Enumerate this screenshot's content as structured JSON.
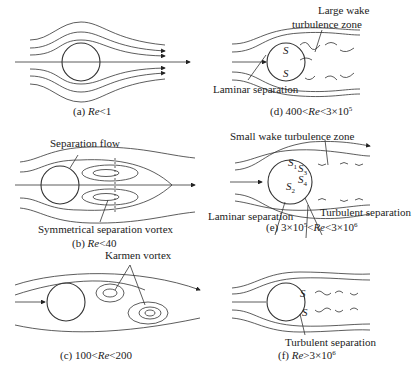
{
  "panels": {
    "a": {
      "caption_prefix": "(a) ",
      "caption_re": "Re",
      "caption_rest": "<1"
    },
    "b": {
      "caption_prefix": "(b) ",
      "caption_re": "Re",
      "caption_rest": "<40",
      "labels": {
        "separation_flow": "Separation flow",
        "vortex": "Symmetrical separation vortex"
      }
    },
    "c": {
      "caption_prefix": "(c) 100<",
      "caption_re": "Re",
      "caption_rest": "<200",
      "labels": {
        "karmen": "Karmen vortex"
      }
    },
    "d": {
      "caption_prefix": "(d) 400<",
      "caption_re": "Re",
      "caption_rest": "<3×10",
      "exp": "5",
      "labels": {
        "wake1": "Large wake",
        "wake2": "turbulence zone",
        "laminar": "Laminar separation",
        "s": "S"
      }
    },
    "e": {
      "caption_prefix": "(e) 3×10",
      "exp1": "5",
      "caption_mid": "<",
      "caption_re": "Re",
      "caption_rest": "<3×10",
      "exp2": "6",
      "labels": {
        "small_wake": "Small wake  turbulence zone",
        "laminar": "Laminar separation",
        "turbulent": "Turbulent separation",
        "s": "S",
        "s1": "1",
        "s2": "2",
        "s3": "3",
        "s4": "4"
      }
    },
    "f": {
      "caption_prefix": "(f) ",
      "caption_re": "Re",
      "caption_rest": ">3×10",
      "exp": "6",
      "labels": {
        "turbulent": "Turbulent separation",
        "s": "S"
      }
    }
  }
}
